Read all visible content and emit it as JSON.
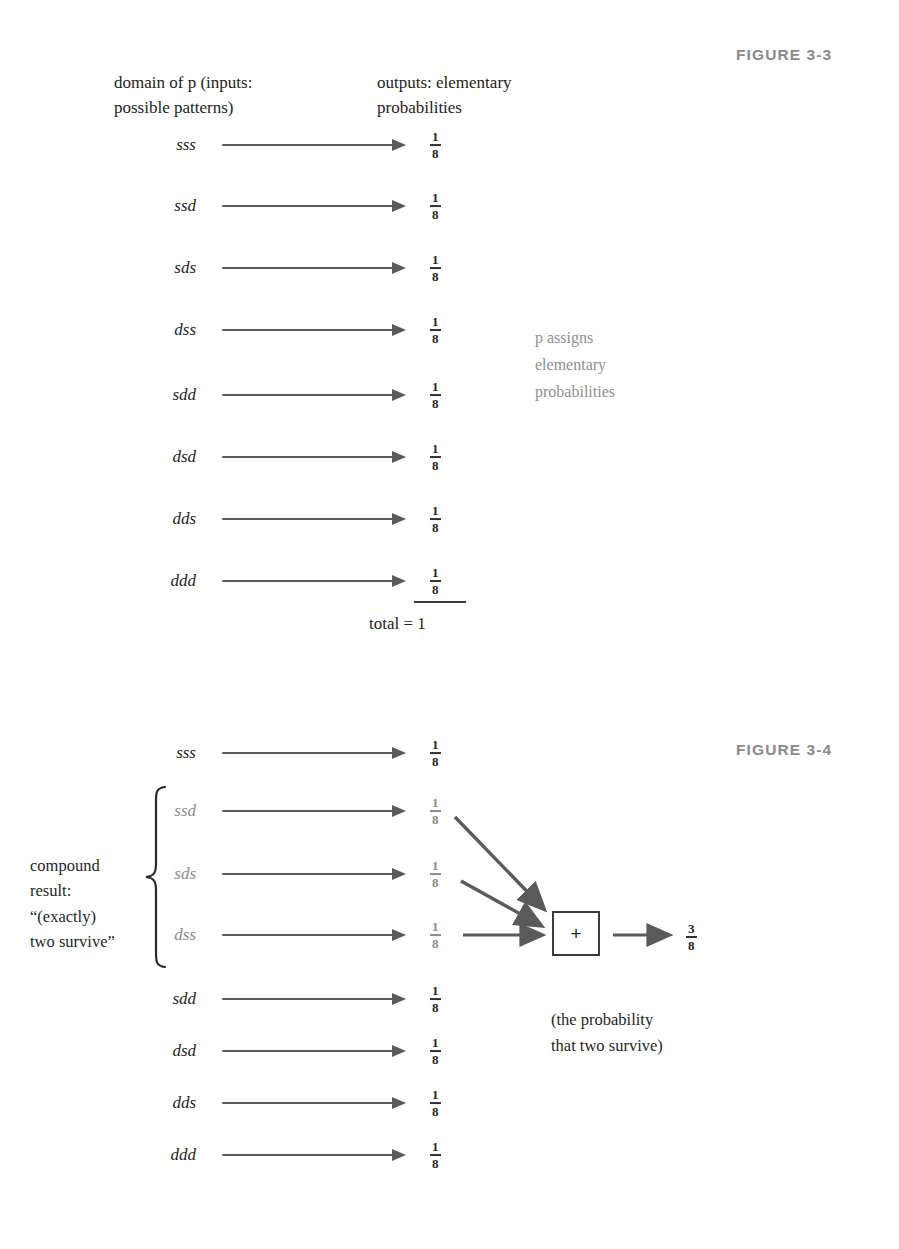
{
  "figure_3_3": {
    "label": "FIGURE  3-3",
    "headers": {
      "domain": "domain of p (inputs:\npossible patterns)",
      "domain_italic_token": "p",
      "outputs": "outputs: elementary\nprobabilities"
    },
    "rows": [
      {
        "pattern": "sss",
        "probability_num": "1",
        "probability_den": "8"
      },
      {
        "pattern": "ssd",
        "probability_num": "1",
        "probability_den": "8"
      },
      {
        "pattern": "sds",
        "probability_num": "1",
        "probability_den": "8"
      },
      {
        "pattern": "dss",
        "probability_num": "1",
        "probability_den": "8"
      },
      {
        "pattern": "sdd",
        "probability_num": "1",
        "probability_den": "8"
      },
      {
        "pattern": "dsd",
        "probability_num": "1",
        "probability_den": "8"
      },
      {
        "pattern": "dds",
        "probability_num": "1",
        "probability_den": "8"
      },
      {
        "pattern": "ddd",
        "probability_num": "1",
        "probability_den": "8"
      }
    ],
    "total_text": "total = 1",
    "side_note": "p assigns\nelementary\nprobabilities",
    "side_note_italic_token": "p"
  },
  "figure_3_4": {
    "label": "FIGURE  3-4",
    "compound_text": "compound\nresult:\n“(exactly)\ntwo survive”",
    "rows": [
      {
        "pattern": "sss",
        "probability_num": "1",
        "probability_den": "8",
        "in_compound": false
      },
      {
        "pattern": "ssd",
        "probability_num": "1",
        "probability_den": "8",
        "in_compound": true
      },
      {
        "pattern": "sds",
        "probability_num": "1",
        "probability_den": "8",
        "in_compound": true
      },
      {
        "pattern": "dss",
        "probability_num": "1",
        "probability_den": "8",
        "in_compound": true
      },
      {
        "pattern": "sdd",
        "probability_num": "1",
        "probability_den": "8",
        "in_compound": false
      },
      {
        "pattern": "dsd",
        "probability_num": "1",
        "probability_den": "8",
        "in_compound": false
      },
      {
        "pattern": "dds",
        "probability_num": "1",
        "probability_den": "8",
        "in_compound": false
      },
      {
        "pattern": "ddd",
        "probability_num": "1",
        "probability_den": "8",
        "in_compound": false
      }
    ],
    "operator": "+",
    "result_num": "3",
    "result_den": "8",
    "caption": "(the probability\nthat two survive)"
  },
  "colors": {
    "arrow": "#5a5a5a",
    "text": "#242424",
    "dim_text": "#8b8b8b",
    "figure_label": "#8a8a8a",
    "box_border": "#3a3a3a",
    "background": "#ffffff"
  }
}
